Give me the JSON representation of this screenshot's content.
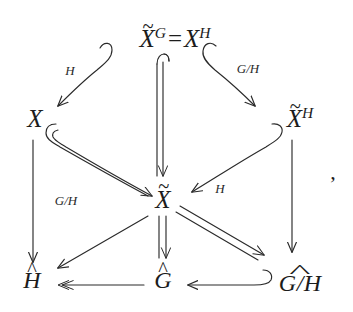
{
  "figure": {
    "type": "commutative-diagram",
    "background_color": "#ffffff",
    "ink_color": "#1c1c1c",
    "trailing_punctuation": ","
  },
  "nodes": {
    "top": {
      "id": "X-tilde-G-eq-X-H",
      "parts": {
        "base1": "X",
        "sup1": "G",
        "equals": "=",
        "base2": "X",
        "sup2": "H"
      },
      "plain_text": "X̃^G = X^H",
      "x": 175,
      "y": 38,
      "font_size": 25
    },
    "left": {
      "id": "X",
      "parts": {
        "base": "X"
      },
      "plain_text": "X",
      "x": 35,
      "y": 118,
      "font_size": 25
    },
    "right": {
      "id": "X-tilde-H",
      "parts": {
        "base": "X",
        "sup": "H"
      },
      "plain_text": "X̃^H",
      "x": 300,
      "y": 118,
      "font_size": 25
    },
    "center": {
      "id": "X-tilde",
      "parts": {
        "base": "X"
      },
      "plain_text": "X̃",
      "x": 163,
      "y": 199,
      "font_size": 25
    },
    "bottom_left": {
      "id": "H-hat",
      "parts": {
        "base": "H"
      },
      "plain_text": "Ĥ",
      "x": 32,
      "y": 280,
      "font_size": 24
    },
    "bottom_center": {
      "id": "G-hat",
      "parts": {
        "base": "G"
      },
      "plain_text": "Ĝ",
      "x": 163,
      "y": 280,
      "font_size": 24
    },
    "bottom_right": {
      "id": "G-over-H-widehat",
      "parts": {
        "numer": "G",
        "slash": "/",
        "denom": "H"
      },
      "plain_text": "G/H with wide hat",
      "x": 300,
      "y": 281,
      "font_size": 24
    }
  },
  "edges": [
    {
      "id": "top-to-left",
      "from": "top",
      "to": "left",
      "label": "H",
      "style": "single-hooked"
    },
    {
      "id": "top-to-right",
      "from": "top",
      "to": "right",
      "label": "G/H",
      "style": "single-hooked"
    },
    {
      "id": "top-to-center",
      "from": "top",
      "to": "center",
      "label": "",
      "style": "double-hooked-vertical"
    },
    {
      "id": "left-to-center",
      "from": "left",
      "to": "center",
      "label": "",
      "style": "double-hooked"
    },
    {
      "id": "right-to-center",
      "from": "right",
      "to": "center",
      "label": "H",
      "style": "single-hooked"
    },
    {
      "id": "left-to-bottom-left",
      "from": "left",
      "to": "bottom_left",
      "label": "G/H",
      "style": "single-vertical"
    },
    {
      "id": "right-to-bottom-right",
      "from": "right",
      "to": "bottom_right",
      "label": "",
      "style": "single-vertical"
    },
    {
      "id": "center-to-bottom-left",
      "from": "center",
      "to": "bottom_left",
      "label": "",
      "style": "single"
    },
    {
      "id": "center-to-bottom-center",
      "from": "center",
      "to": "bottom_center",
      "label": "",
      "style": "double-vertical"
    },
    {
      "id": "center-to-bottom-right",
      "from": "center",
      "to": "bottom_right",
      "label": "",
      "style": "double"
    },
    {
      "id": "bottom-center-to-bottom-left",
      "from": "bottom_center",
      "to": "bottom_left",
      "label": "",
      "style": "single-horizontal"
    },
    {
      "id": "bottom-right-to-bottom-center",
      "from": "bottom_right",
      "to": "bottom_center",
      "label": "",
      "style": "single-hooked-horizontal"
    }
  ],
  "edge_labels": {
    "top_left_H": "H",
    "top_right_G_over_H": "G/H",
    "left_vertical_G_over_H": "G/H",
    "right_center_H": "H"
  },
  "glyphs": {
    "tilde": "~",
    "hat": "^",
    "equals": "=",
    "slash": "/"
  }
}
